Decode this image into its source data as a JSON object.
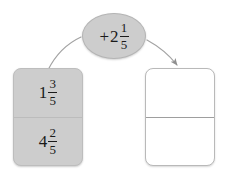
{
  "canvas": {
    "width": 226,
    "height": 179,
    "background": "#ffffff"
  },
  "palette": {
    "card_fill_gray": "#cdcdcd",
    "card_fill_white": "#ffffff",
    "card_border": "#bdbdbd",
    "divider": "#bcbcbc",
    "text": "#1a1a1a",
    "connector": "#9a9a9a"
  },
  "operation": {
    "bubble_label": "+2 1/5",
    "operator": "+",
    "whole": "2",
    "numerator": "1",
    "denominator": "5"
  },
  "input_card": {
    "name": "input-values",
    "fill": "#cdcdcd",
    "cells": [
      {
        "label": "1 3/5",
        "whole": "1",
        "numerator": "3",
        "denominator": "5"
      },
      {
        "label": "4 2/5",
        "whole": "4",
        "numerator": "2",
        "denominator": "5"
      }
    ]
  },
  "output_card": {
    "name": "output-values",
    "fill": "#ffffff",
    "cells": [
      {
        "label": ""
      },
      {
        "label": ""
      }
    ]
  },
  "connectors": [
    {
      "name": "input-to-operation",
      "from": "input-card-top",
      "to": "operation-bubble",
      "arrowhead": false
    },
    {
      "name": "operation-to-output",
      "from": "operation-bubble",
      "to": "output-card-top",
      "arrowhead": true
    }
  ]
}
